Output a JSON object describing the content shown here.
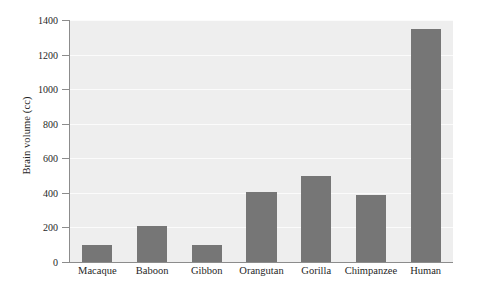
{
  "chart_data": {
    "type": "bar",
    "title": "",
    "xlabel": "",
    "ylabel": "Brain volume (cc)",
    "categories": [
      "Macaque",
      "Baboon",
      "Gibbon",
      "Orangutan",
      "Gorilla",
      "Chimpanzee",
      "Human"
    ],
    "values": [
      100,
      210,
      100,
      405,
      495,
      390,
      1350
    ],
    "ylim": [
      0,
      1400
    ],
    "yticks": [
      0,
      200,
      400,
      600,
      800,
      1000,
      1200,
      1400
    ],
    "ytick_labels": [
      "0",
      "200",
      "400",
      "600",
      "800",
      "1000",
      "1200",
      "1400"
    ],
    "grid": true,
    "legend": null,
    "colors": {
      "bar": "#767676",
      "plot_background": "#eeeeee",
      "gridline": "#fbfbfb",
      "axis": "#8c8c8c",
      "text": "#1f1f1f",
      "figure_background": "#ffffff"
    }
  }
}
